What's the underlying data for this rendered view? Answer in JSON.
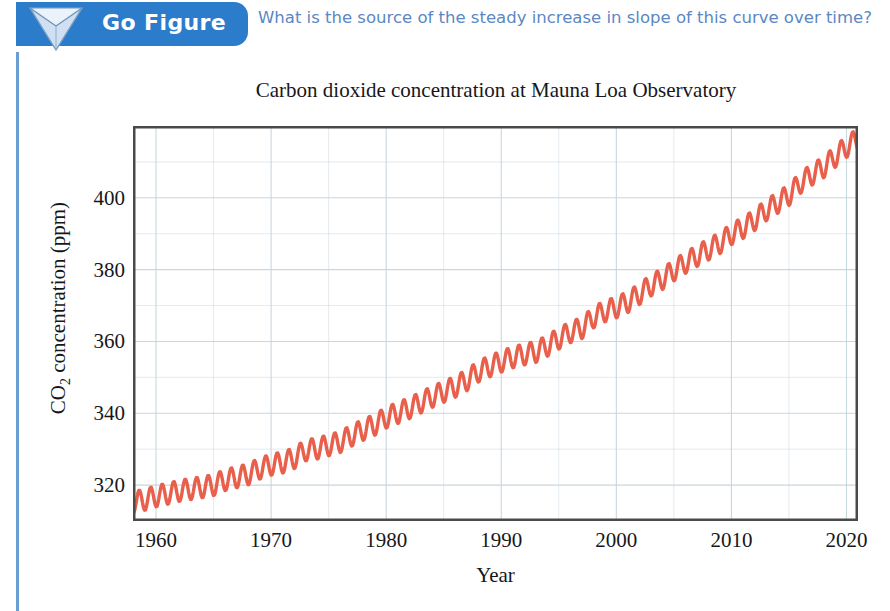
{
  "banner": {
    "label": "Go Figure",
    "icon": "inverted-triangle-icon",
    "bg_color": "#2c7ccc",
    "text_color": "#ffffff"
  },
  "question": {
    "text": "What is the source of the steady increase in slope of this curve over time?",
    "color": "#5b87c4"
  },
  "accent": {
    "left_rule_color": "#6b9fd4",
    "curve_color": "#e8604c",
    "grid_color": "#c6d6de",
    "frame_color": "#4a4a4a"
  },
  "chart_data": {
    "type": "line",
    "title": "Carbon dioxide concentration at Mauna Loa Observatory",
    "subtitle": "",
    "xlabel": "Year",
    "ylabel": "CO2 concentration (ppm)",
    "ylabel_html": "CO<sub>2</sub> concentration (ppm)",
    "xlim": [
      1958,
      2021
    ],
    "ylim": [
      310,
      420
    ],
    "xticks": [
      1960,
      1970,
      1980,
      1990,
      2000,
      2010,
      2020
    ],
    "xtick_labels": [
      "1960",
      "1970",
      "1980",
      "1990",
      "2000",
      "2010",
      "2020"
    ],
    "yticks": [
      320,
      340,
      360,
      380,
      400
    ],
    "ytick_labels": [
      "320",
      "340",
      "360",
      "380",
      "400"
    ],
    "minor_x_step": 5,
    "minor_y_step": 10,
    "grid": true,
    "legend": null,
    "seasonal_amplitude_ppm": 3.0,
    "series": [
      {
        "name": "Annual mean CO2 (Keeling Curve)",
        "color": "#e8604c",
        "x": [
          1958,
          1959,
          1960,
          1961,
          1962,
          1963,
          1964,
          1965,
          1966,
          1967,
          1968,
          1969,
          1970,
          1971,
          1972,
          1973,
          1974,
          1975,
          1976,
          1977,
          1978,
          1979,
          1980,
          1981,
          1982,
          1983,
          1984,
          1985,
          1986,
          1987,
          1988,
          1989,
          1990,
          1991,
          1992,
          1993,
          1994,
          1995,
          1996,
          1997,
          1998,
          1999,
          2000,
          2001,
          2002,
          2003,
          2004,
          2005,
          2006,
          2007,
          2008,
          2009,
          2010,
          2011,
          2012,
          2013,
          2014,
          2015,
          2016,
          2017,
          2018,
          2019,
          2020,
          2021
        ],
        "values": [
          315.3,
          315.9,
          316.9,
          317.6,
          318.4,
          318.9,
          319.4,
          320.0,
          321.4,
          322.2,
          323.0,
          324.6,
          325.7,
          326.3,
          327.5,
          329.7,
          330.2,
          331.1,
          332.0,
          333.8,
          335.4,
          336.8,
          338.8,
          340.1,
          341.4,
          343.0,
          344.6,
          346.0,
          347.4,
          349.2,
          351.6,
          353.1,
          354.4,
          355.6,
          356.4,
          357.1,
          358.8,
          360.8,
          362.6,
          363.7,
          366.7,
          368.4,
          369.5,
          371.0,
          373.2,
          375.6,
          377.4,
          379.8,
          381.9,
          383.8,
          385.6,
          387.4,
          389.9,
          391.6,
          393.8,
          396.5,
          398.6,
          400.8,
          404.2,
          406.5,
          408.5,
          411.4,
          414.2,
          416.4
        ]
      }
    ]
  }
}
